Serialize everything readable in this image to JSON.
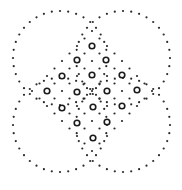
{
  "image": {
    "width": 182,
    "height": 190,
    "background": "#ffffff",
    "dot_color": "#2a2a2a",
    "ring_color": "#1a1a1a"
  },
  "pattern": {
    "description": "Quatrefoil of four dotted circles with an inner diamond lattice of dots and ring markers",
    "circles": [
      {
        "cx": 60,
        "cy": 58,
        "r": 47,
        "dots": 36
      },
      {
        "cx": 123,
        "cy": 58,
        "r": 47,
        "dots": 36
      },
      {
        "cx": 60,
        "cy": 125,
        "r": 47,
        "dots": 36
      },
      {
        "cx": 123,
        "cy": 125,
        "r": 47,
        "dots": 36
      }
    ],
    "lattice": {
      "cx": 92,
      "cy": 91,
      "step": 7.5,
      "max_manhattan": 8
    },
    "rings": [
      [
        92,
        46
      ],
      [
        77,
        60
      ],
      [
        106,
        60
      ],
      [
        62,
        76
      ],
      [
        92,
        75
      ],
      [
        122,
        75
      ],
      [
        47,
        91
      ],
      [
        77,
        92
      ],
      [
        107,
        91
      ],
      [
        137,
        90
      ],
      [
        62,
        108
      ],
      [
        93,
        107
      ],
      [
        122,
        106
      ],
      [
        77,
        123
      ],
      [
        107,
        122
      ],
      [
        93,
        138
      ]
    ],
    "dot_radius": 1.1,
    "ring_radius": 2.8,
    "ring_stroke": 1.6
  }
}
